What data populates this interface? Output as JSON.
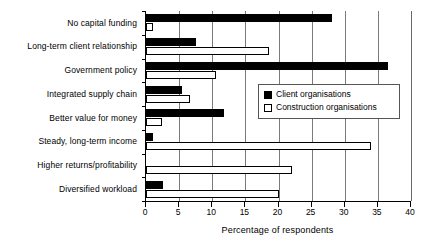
{
  "chart_data": {
    "type": "bar",
    "orientation": "horizontal",
    "title": "",
    "xlabel": "Percentage of respondents",
    "ylabel": "",
    "xlim": [
      0,
      40
    ],
    "xticks": [
      0,
      5,
      10,
      15,
      20,
      25,
      30,
      35,
      40
    ],
    "xtick_labels": [
      "0",
      "5",
      "10",
      "15",
      "20",
      "25",
      "30",
      "35",
      "40"
    ],
    "grid": "vertical",
    "legend_position": "center-right",
    "categories": [
      "No capital funding",
      "Long-term client relationship",
      "Government policy",
      "Integrated supply chain",
      "Better value for money",
      "Steady, long-term income",
      "Higher returns/profitability",
      "Diversified workload"
    ],
    "series": [
      {
        "name": "Client organisations",
        "fill": "#000000",
        "values": [
          28,
          7.5,
          36.5,
          5.5,
          11.8,
          1,
          0,
          2.5
        ]
      },
      {
        "name": "Construction organisations",
        "fill": "#ffffff",
        "values": [
          1,
          18.5,
          10.5,
          6.7,
          2.4,
          34,
          22,
          20
        ]
      }
    ]
  },
  "legend": {
    "items": [
      {
        "label": "Client organisations",
        "swatch": "filled-square-icon"
      },
      {
        "label": "Construction organisations",
        "swatch": "hollow-square-icon"
      }
    ]
  },
  "colors": {
    "client": "#000000",
    "construction": "#ffffff",
    "axis": "#000000",
    "grid": "#7a7a7a",
    "background": "#ffffff"
  }
}
